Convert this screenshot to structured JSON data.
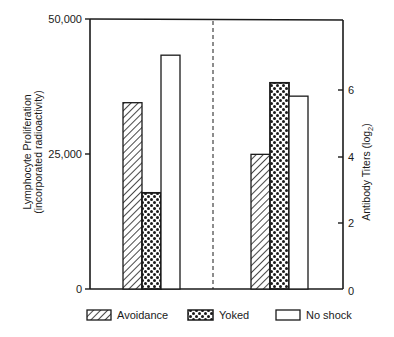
{
  "chart_data": {
    "type": "bar",
    "title": "",
    "panels": [
      {
        "name": "Lymphocyte Proliferation",
        "axis": "left",
        "ylabel_line1": "Lymphocyte Proliferation",
        "ylabel_line2": "(incorporated radioactivity)",
        "ylim": [
          0,
          50000
        ],
        "ticks": [
          0,
          25000,
          50000
        ],
        "tick_labels": [
          "0",
          "25,000",
          "50,000"
        ]
      },
      {
        "name": "Antibody Titers",
        "axis": "right",
        "ylabel": "Antibody Titers (log2)",
        "ylim": [
          0,
          8
        ],
        "ticks": [
          0,
          2,
          4,
          6
        ],
        "tick_labels": [
          "0",
          "2",
          "4",
          "6"
        ]
      }
    ],
    "categories": [
      "Lymphocyte Proliferation",
      "Antibody Titers"
    ],
    "series": [
      {
        "name": "Avoidance",
        "pattern": "hatch",
        "values": [
          34500,
          4.05
        ]
      },
      {
        "name": "Yoked",
        "pattern": "dots",
        "values": [
          17800,
          6.2
        ]
      },
      {
        "name": "No shock",
        "pattern": "empty",
        "values": [
          43300,
          5.8
        ]
      }
    ],
    "divider": "dashed vertical line separating the two panels",
    "grid": false,
    "legend_position": "bottom"
  },
  "axes": {
    "left": {
      "label_line1": "Lymphocyte Proliferation",
      "label_line2": "(incorporated radioactivity)",
      "ticks": [
        "50,000",
        "25,000",
        "0"
      ]
    },
    "right": {
      "label_main": "Antibody Titers (log",
      "label_sub": "2",
      "label_close": ")",
      "ticks": [
        "6",
        "4",
        "2",
        "0"
      ]
    }
  },
  "legend": {
    "items": [
      {
        "label": "Avoidance",
        "pattern": "hatch"
      },
      {
        "label": "Yoked",
        "pattern": "dots"
      },
      {
        "label": "No shock",
        "pattern": "empty"
      }
    ]
  },
  "colors": {
    "ink": "#1a1a1a",
    "background": "#ffffff"
  }
}
